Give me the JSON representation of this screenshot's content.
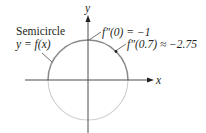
{
  "diagram": {
    "axes": {
      "x_label": "x",
      "y_label": "y"
    },
    "curve_label": {
      "line1": "Semicircle",
      "line2": "y = f(x)"
    },
    "annotations": [
      {
        "text": "f″(0) = −1",
        "x": 0,
        "second_derivative": -1
      },
      {
        "text": "f″(0.7) ≈ −2.75",
        "x": 0.7,
        "second_derivative": -2.75
      }
    ],
    "colors": {
      "upper_semicircle": "#8a8a8a",
      "lower_semicircle": "#cfcfcf",
      "axes": "#4d4d4d",
      "text": "#231f20"
    }
  }
}
